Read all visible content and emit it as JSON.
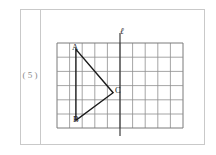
{
  "page": {
    "background_color": "#ffffff",
    "width": 216,
    "height": 155
  },
  "problem": {
    "number_label": "( 5 )",
    "border_color": "#c9c9c9"
  },
  "figure": {
    "grid": {
      "columns": 10,
      "rows": 6,
      "cell_width": 12.6,
      "cell_height": 14.2,
      "line_color": "#8e8e8e",
      "border_color": "#7a7a7a"
    },
    "mirror_line": {
      "label": "ℓ",
      "orientation": "vertical",
      "grid_column": 5,
      "color": "#2b2b2b"
    },
    "triangle": {
      "stroke_color": "#1a1a1a",
      "vertices": [
        {
          "name": "A",
          "label": "A",
          "grid_x": 1.5,
          "grid_y": 0.45
        },
        {
          "name": "B",
          "label": "B",
          "grid_x": 1.5,
          "grid_y": 5.45
        },
        {
          "name": "C",
          "label": "C",
          "grid_x": 4.45,
          "grid_y": 3.5
        }
      ]
    }
  }
}
